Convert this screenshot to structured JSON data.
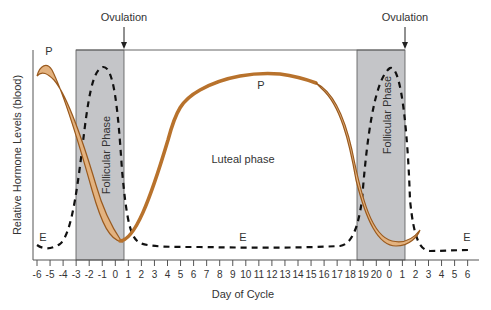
{
  "chart_data": {
    "type": "line",
    "title": "",
    "xlabel": "Day of Cycle",
    "ylabel": "Relative Hormone Levels (blood)",
    "x_tick_labels": [
      "-6",
      "-5",
      "-4",
      "-3",
      "-2",
      "-1",
      "0",
      "1",
      "2",
      "3",
      "4",
      "5",
      "6",
      "7",
      "8",
      "9",
      "10",
      "11",
      "12",
      "13",
      "14",
      "15",
      "16",
      "17",
      "18",
      "19",
      "20",
      "0",
      "1",
      "2",
      "3",
      "4",
      "5",
      "6"
    ],
    "annotations": {
      "ovulation_1": "Ovulation",
      "ovulation_2": "Ovulation",
      "follicular_1": "Follicular Phase",
      "follicular_2": "Follicular Phase",
      "luteal": "Luteal phase",
      "p_label_1": "P",
      "p_label_2": "P",
      "e_label_1": "E",
      "e_label_2": "E",
      "e_label_3": "E"
    },
    "series": [
      {
        "name": "P (progesterone)",
        "style": "solid-band",
        "color": "#b8722c",
        "description": "High at start, drops through first follicular phase to minimum at ovulation, rises to plateau in luteal phase, drops through second follicular phase to minimum at ovulation"
      },
      {
        "name": "E (estrogen)",
        "style": "dashed",
        "color": "#111111",
        "description": "Low baseline, sharp peaks within each follicular phase just before ovulation, low baseline during luteal phase"
      }
    ],
    "shaded_regions": [
      {
        "label": "Follicular Phase",
        "x_start": -3.2,
        "x_end": 0.5
      },
      {
        "label": "Follicular Phase",
        "x_start": 18.2,
        "x_end": 1
      }
    ],
    "grid": false,
    "legend": "inline labels"
  },
  "colors": {
    "progesterone": "#b8722c",
    "progesterone_light": "#e3b27f",
    "shade": "#c4c5c8",
    "axis": "#555555"
  }
}
